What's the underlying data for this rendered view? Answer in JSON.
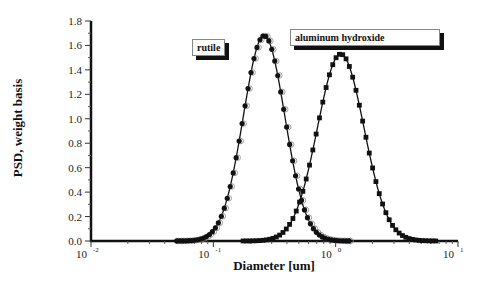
{
  "chart_data": {
    "type": "line",
    "title": "",
    "xlabel": "Diameter [um]",
    "ylabel": "PSD, weight basis",
    "xscale": "log",
    "xlim": [
      0.01,
      10
    ],
    "ylim": [
      0,
      1.8
    ],
    "x_ticks": [
      {
        "base": "10",
        "exp": "-2"
      },
      {
        "base": "10",
        "exp": "-1"
      },
      {
        "base": "10",
        "exp": "0"
      },
      {
        "base": "10",
        "exp": "1"
      }
    ],
    "y_ticks": [
      "0.0",
      "0.2",
      "0.4",
      "0.6",
      "0.8",
      "1.0",
      "1.2",
      "1.4",
      "1.6",
      "1.8"
    ],
    "grid": false,
    "legend_position": "inline labels",
    "series": [
      {
        "name": "rutile",
        "distribution": "lognormal",
        "peak_x": 0.26,
        "peak_y": 1.68,
        "log10_sigma": 0.17,
        "marker": "filled circle + open circle"
      },
      {
        "name": "aluminum hydroxide",
        "distribution": "lognormal",
        "peak_x": 1.1,
        "peak_y": 1.53,
        "log10_sigma": 0.19,
        "marker": "filled square"
      }
    ]
  },
  "legend": {
    "rutile": "rutile",
    "aluminum": "aluminum hydroxide"
  }
}
